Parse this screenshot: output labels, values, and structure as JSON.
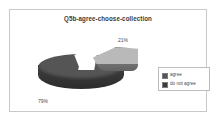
{
  "frame": {
    "border_color": "#c9c9c9",
    "background": "#ffffff"
  },
  "chart_data": {
    "type": "pie",
    "title": "Q5b-agree-choose-collection",
    "xlabel": "",
    "ylabel": "",
    "exploded_slice": "do not agree",
    "three_d": true,
    "legend_position": "right",
    "grid": false,
    "categories": [
      "agree",
      "do not agree"
    ],
    "values": [
      79,
      21
    ],
    "data_labels": [
      "79%",
      "21%"
    ],
    "colors": [
      "#555555",
      "#b9b9b9"
    ],
    "slices": [
      {
        "label": "agree",
        "value": 79,
        "data_label": "79%",
        "color": "#555555"
      },
      {
        "label": "do not agree",
        "value": 21,
        "data_label": "21%",
        "color": "#b9b9b9"
      }
    ]
  },
  "legend": {
    "items": [
      {
        "label": "agree",
        "color": "#555555"
      },
      {
        "label": "do not agree",
        "color": "#3d3d3d"
      }
    ]
  }
}
